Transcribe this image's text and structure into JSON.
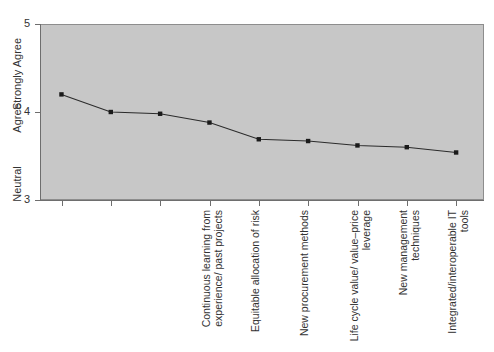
{
  "chart_data": {
    "type": "line",
    "title": "",
    "xlabel": "",
    "ylabel": "",
    "ylim": [
      3,
      5
    ],
    "grid": false,
    "legend": "none",
    "background_color": "#c7c7c7",
    "line_color": "#2b2b2b",
    "marker_color": "#1a1a1a",
    "ytick_values": [
      5,
      4,
      3
    ],
    "ytick_labels": [
      "5",
      "4",
      "3"
    ],
    "ytick_text_labels": [
      "Strongly Agree",
      "Agree",
      "Neutral"
    ],
    "categories": [
      "Continuous learning from experience/ past projects",
      "Equitable allocation of risk",
      "New procurement methods",
      "Life cycle value/ value–price leverage",
      "New management techniques",
      "Integrated/interoperable IT tools",
      "Environmental awareness",
      "Socially responsible design",
      "An emphasis on culture/trust issues"
    ],
    "values": [
      4.2,
      4.0,
      3.98,
      3.88,
      3.69,
      3.67,
      3.62,
      3.6,
      3.54
    ]
  },
  "axis": {
    "y_words": [
      {
        "text": "Strongly Agree",
        "top": 68
      },
      {
        "text": "Agree",
        "top": 112
      },
      {
        "text": "Neutral",
        "top": 178
      }
    ]
  }
}
